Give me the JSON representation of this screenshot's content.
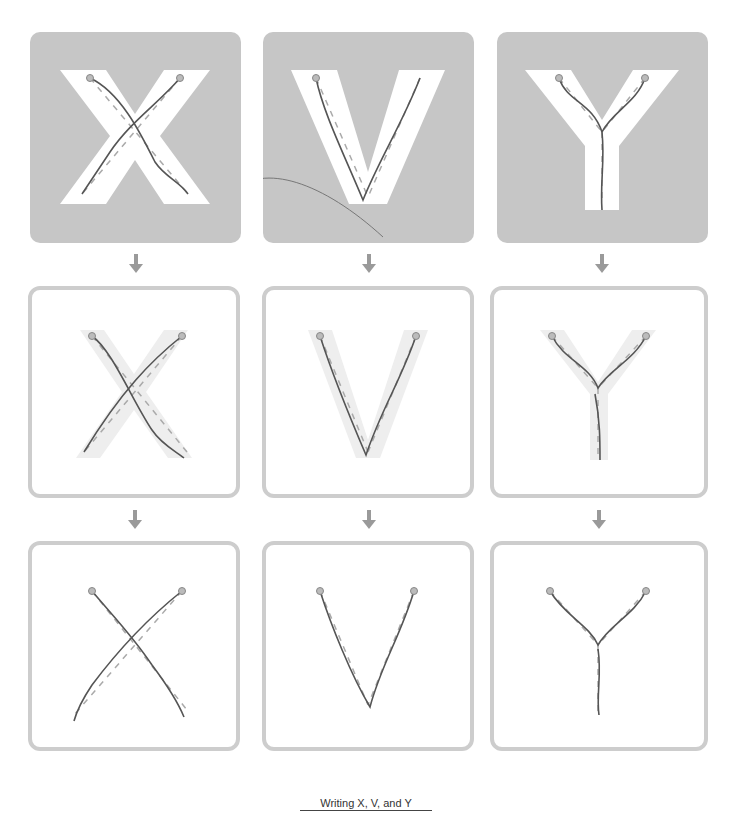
{
  "worksheet": {
    "caption": "Writing X, V, and Y",
    "columns": [
      {
        "letter": "X"
      },
      {
        "letter": "V"
      },
      {
        "letter": "Y"
      }
    ],
    "rows": [
      {
        "style": "bold-outline-on-gray"
      },
      {
        "style": "faint-guide-in-bordered-box"
      },
      {
        "style": "dots-only-in-bordered-box"
      }
    ],
    "colors": {
      "gray_fill": "#c6c6c6",
      "box_border": "#cdcdcd",
      "arrow": "#9a9a9a",
      "pencil": "#555555",
      "guide_dash": "#aaaaaa",
      "dot": "#999999"
    }
  }
}
